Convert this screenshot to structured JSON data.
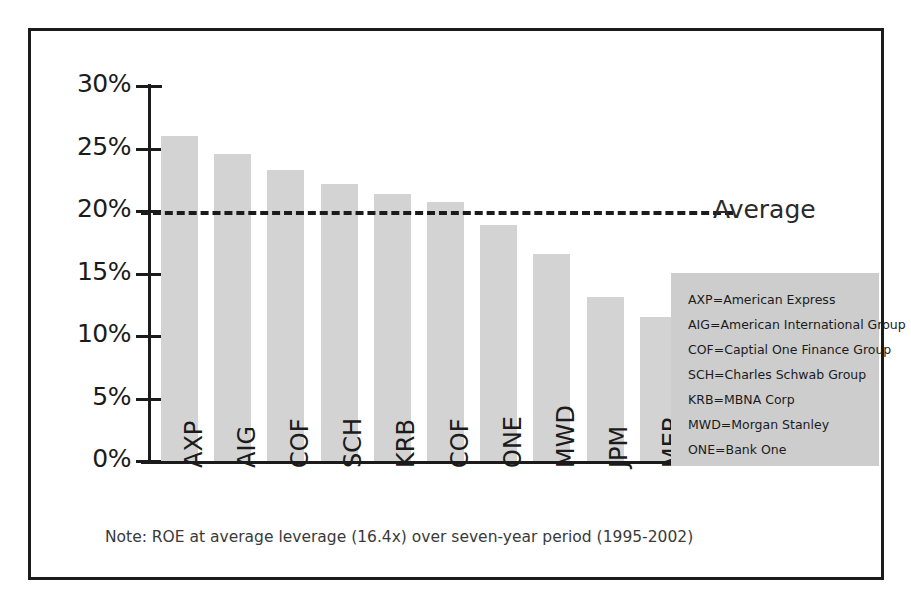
{
  "chart_data": {
    "type": "bar",
    "title": "",
    "xlabel": "",
    "ylabel": "",
    "ylim": [
      0,
      30
    ],
    "grid": false,
    "categories": [
      "AXP",
      "AIG",
      "COF",
      "SCH",
      "KRB",
      "COF",
      "ONE",
      "MWD",
      "JPM",
      "MER"
    ],
    "values": [
      26.0,
      24.6,
      23.3,
      22.2,
      21.4,
      20.7,
      18.9,
      16.6,
      13.1,
      11.5
    ],
    "ytick_labels": [
      "30%",
      "25%",
      "20%",
      "15%",
      "10%",
      "5%",
      "0%"
    ],
    "ytick_values": [
      30,
      25,
      20,
      15,
      10,
      5,
      0
    ],
    "annotations": [
      {
        "name": "average-line",
        "label": "Average",
        "value": 20.0,
        "style": "dashed-horizontal"
      }
    ],
    "note": "Note: ROE at average leverage (16.4x) over seven-year period (1995-2002)",
    "legend_position": "inside-right",
    "legend_entries": [
      "AXP=American Express",
      "AIG=American International Group",
      "COF=Captial One Finance Group",
      "SCH=Charles Schwab Group",
      "KRB=MBNA Corp",
      "MWD=Morgan Stanley",
      "ONE=Bank One"
    ],
    "colors": {
      "bar_fill": "#d3d3d3",
      "axis": "#1b1b1b",
      "average_line": "#1b1b1b",
      "legend_background": "#cdcdcd",
      "note_text": "#3a3a3a",
      "frame": "#1b1b1b",
      "background": "#ffffff"
    }
  }
}
